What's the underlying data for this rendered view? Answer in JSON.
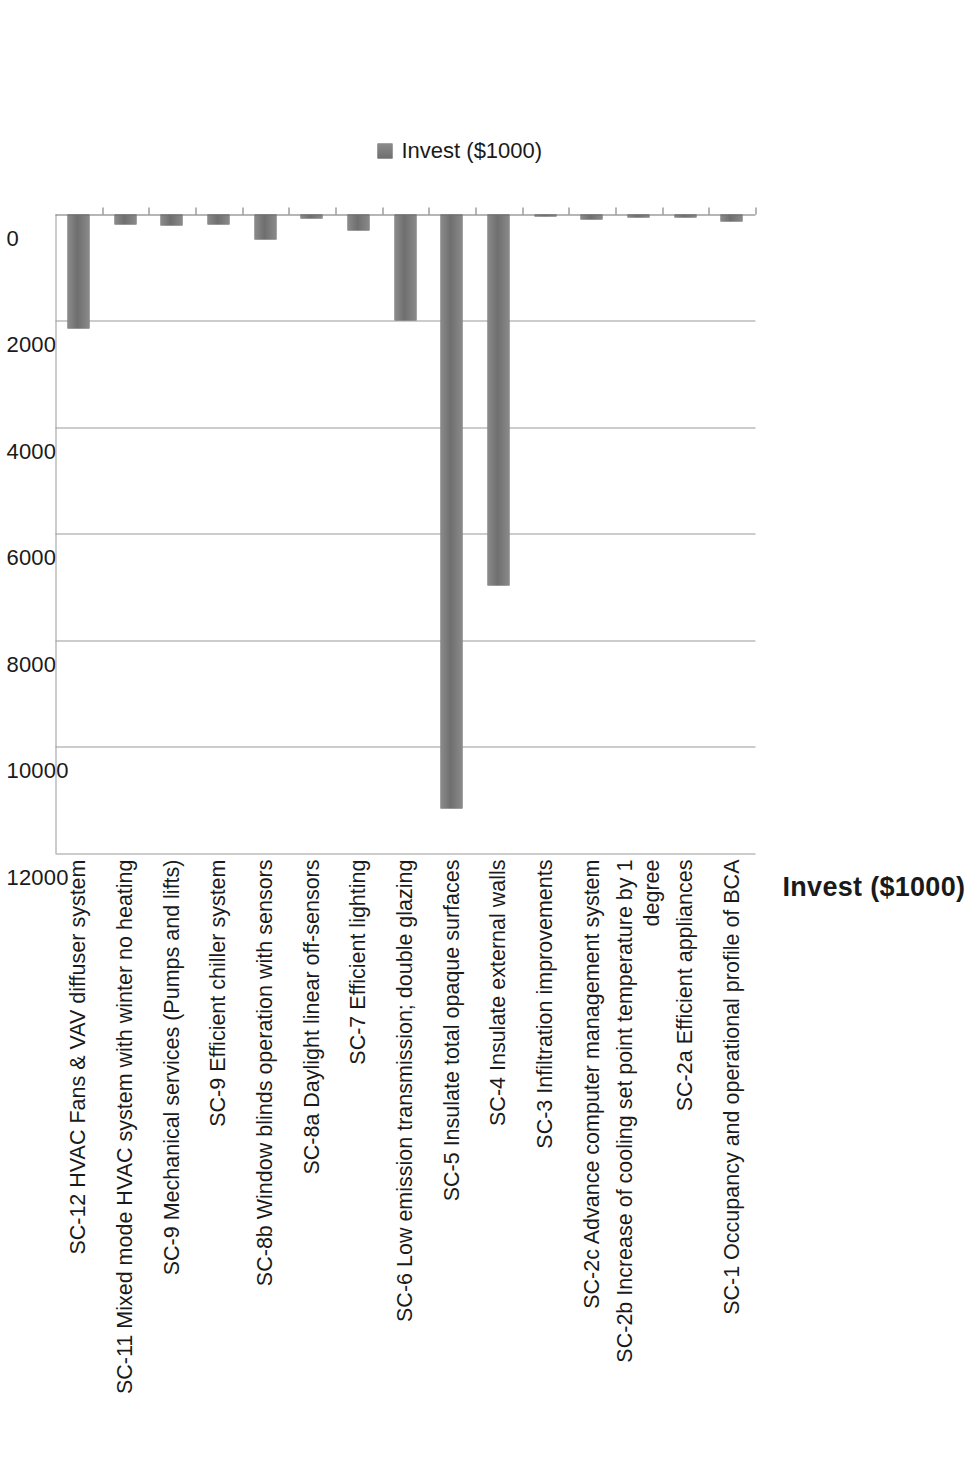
{
  "chart_data": {
    "type": "bar",
    "orientation": "vertical",
    "title": "",
    "xlabel": "",
    "ylabel": "Invest ($1000)",
    "ylim": [
      0,
      12000
    ],
    "ytick_labels": [
      "0",
      "2000",
      "4000",
      "6000",
      "8000",
      "10000",
      "12000"
    ],
    "ytick_values": [
      0,
      2000,
      4000,
      6000,
      8000,
      10000,
      12000
    ],
    "grid": true,
    "legend_position": "top-right",
    "legend": [
      "Invest ($1000)"
    ],
    "series_color": "#7b7b7b",
    "categories": [
      "SC-12 HVAC Fans & VAV diffuser system",
      "SC-11 Mixed mode HVAC system with winter no heating",
      "SC-9 Mechanical services (Pumps and lifts)",
      "SC-9 Efficient chiller system",
      "SC-8b Window blinds operation with sensors",
      "SC-8a Daylight linear off-sensors",
      "SC-7 Efficient lighting",
      "SC-6 Low emission transmission; double glazing",
      "SC-5 Insulate total opaque surfaces",
      "SC-4 Insulate external walls",
      "SC-3 Infiltration improvements",
      "SC-2c Advance computer management system",
      "SC-2b Increase of cooling set point temperature by 1\ndegree",
      "SC-2a Efficient appliances",
      "SC-1 Occupancy and operational profile of BCA"
    ],
    "series": [
      {
        "name": "Invest ($1000)",
        "values": [
          2150,
          190,
          200,
          190,
          470,
          70,
          300,
          2000,
          11150,
          6960,
          40,
          90,
          50,
          60,
          130
        ]
      }
    ]
  },
  "axis_title": "Invest ($1000)",
  "legend": {
    "label": "Invest ($1000)",
    "swatch_color": "#7b7b7b"
  }
}
